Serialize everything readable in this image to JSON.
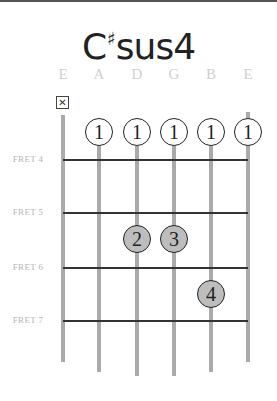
{
  "chord": {
    "root": "C",
    "accidental": "♯",
    "quality": "sus4"
  },
  "strings": [
    {
      "name": "E",
      "x": 63,
      "top": 115,
      "bottom": 362
    },
    {
      "name": "A",
      "x": 99,
      "top": 146,
      "bottom": 372
    },
    {
      "name": "D",
      "x": 137,
      "top": 146,
      "bottom": 376
    },
    {
      "name": "G",
      "x": 174,
      "top": 146,
      "bottom": 376
    },
    {
      "name": "B",
      "x": 211,
      "top": 146,
      "bottom": 372
    },
    {
      "name": "E",
      "x": 248,
      "top": 112,
      "bottom": 362
    }
  ],
  "frets": [
    {
      "label": "FRET 4",
      "y": 160
    },
    {
      "label": "FRET 5",
      "y": 213
    },
    {
      "label": "FRET 6",
      "y": 268
    },
    {
      "label": "FRET 7",
      "y": 321
    }
  ],
  "muted": {
    "string": 0,
    "symbol": "☒",
    "x": 56,
    "y": 96
  },
  "fingers": [
    {
      "finger": "1",
      "string": 1,
      "x": 99,
      "y": 132,
      "style": "open"
    },
    {
      "finger": "1",
      "string": 2,
      "x": 137,
      "y": 132,
      "style": "open"
    },
    {
      "finger": "1",
      "string": 3,
      "x": 174,
      "y": 132,
      "style": "open"
    },
    {
      "finger": "1",
      "string": 4,
      "x": 211,
      "y": 132,
      "style": "open"
    },
    {
      "finger": "1",
      "string": 5,
      "x": 248,
      "y": 132,
      "style": "open"
    },
    {
      "finger": "2",
      "string": 2,
      "x": 137,
      "y": 239,
      "style": "fretted"
    },
    {
      "finger": "3",
      "string": 3,
      "x": 174,
      "y": 239,
      "style": "fretted"
    },
    {
      "finger": "4",
      "string": 4,
      "x": 211,
      "y": 294,
      "style": "fretted"
    }
  ],
  "colors": {
    "string": "#aaaaaa",
    "fret": "#333333",
    "fretted_fill": "#bdbdbd",
    "note_label": "#d0d0d0"
  }
}
